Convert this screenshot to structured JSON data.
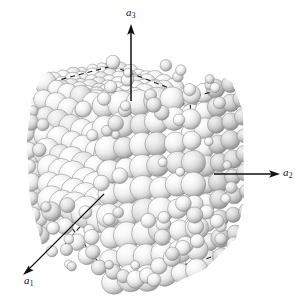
{
  "figure": {
    "background_color": "#ffffff"
  },
  "axes": {
    "a1": {
      "name": "a1",
      "label_base": "a",
      "label_sub": "1",
      "direction": "down-left",
      "arrow_start_x": 104,
      "arrow_start_y": 194,
      "arrow_end_x": 24,
      "arrow_end_y": 274,
      "color": "#111111"
    },
    "a2": {
      "name": "a2",
      "label_base": "a",
      "label_sub": "2",
      "direction": "right",
      "arrow_start_x": 214,
      "arrow_start_y": 174,
      "arrow_end_x": 279,
      "arrow_end_y": 174,
      "color": "#111111"
    },
    "a3": {
      "name": "a3",
      "label_base": "a",
      "label_sub": "3",
      "direction": "up",
      "arrow_start_x": 131,
      "arrow_start_y": 101,
      "arrow_end_x": 131,
      "arrow_end_y": 26,
      "color": "#111111"
    }
  },
  "unit_cell": {
    "line_style": "dashed",
    "line_color": "#1a1a1a",
    "line_width": 1.1,
    "dash_pattern": "5,4",
    "vertices": {
      "top_front": [
        105,
        106
      ],
      "top_left": [
        44,
        84
      ],
      "top_right": [
        190,
        96
      ],
      "top_back": [
        128,
        70
      ],
      "bottom_front": [
        113,
        281
      ],
      "bottom_left": [
        50,
        200
      ],
      "bottom_right": [
        196,
        262
      ],
      "mid_right": [
        193,
        183
      ]
    }
  },
  "spheres": {
    "fill_highlight": "#fdfdfd",
    "fill_mid": "#e8e8e8",
    "fill_shadow": "#9a9a9a",
    "edge_color": "#8d8d8d",
    "count": 317,
    "material": "grayscale shaded sphere"
  },
  "chart_data": {
    "type": "scatter",
    "xlabel": "",
    "ylabel": "",
    "legend": [
      "a1",
      "a2",
      "a3"
    ]
  }
}
